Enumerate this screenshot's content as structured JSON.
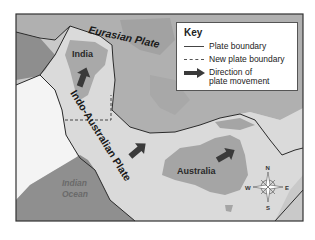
{
  "map": {
    "labels": {
      "eurasian_plate": "Eurasian Plate",
      "india": "India",
      "indo_australian_plate": "Indo-Australian Plate",
      "indian_ocean_line1": "Indian",
      "indian_ocean_line2": "Ocean",
      "australia": "Australia"
    },
    "compass": {
      "n": "N",
      "s": "S",
      "e": "E",
      "w": "W"
    },
    "colors": {
      "land_dark": "#9a9a9a",
      "land_mid": "#b3b3b3",
      "plate_light": "#d9d9d9",
      "ocean_dark": "#8f8f8f",
      "white_region": "#f4f4f4",
      "arrow": "#3a3a3a",
      "boundary": "#2a2a2a"
    }
  },
  "key": {
    "title": "Key",
    "items": [
      {
        "symbol": "solid-line",
        "label": "Plate boundary"
      },
      {
        "symbol": "dashed-line",
        "label": "New plate boundary"
      },
      {
        "symbol": "arrow",
        "label_line1": "Direction of",
        "label_line2": "plate movement"
      }
    ]
  }
}
